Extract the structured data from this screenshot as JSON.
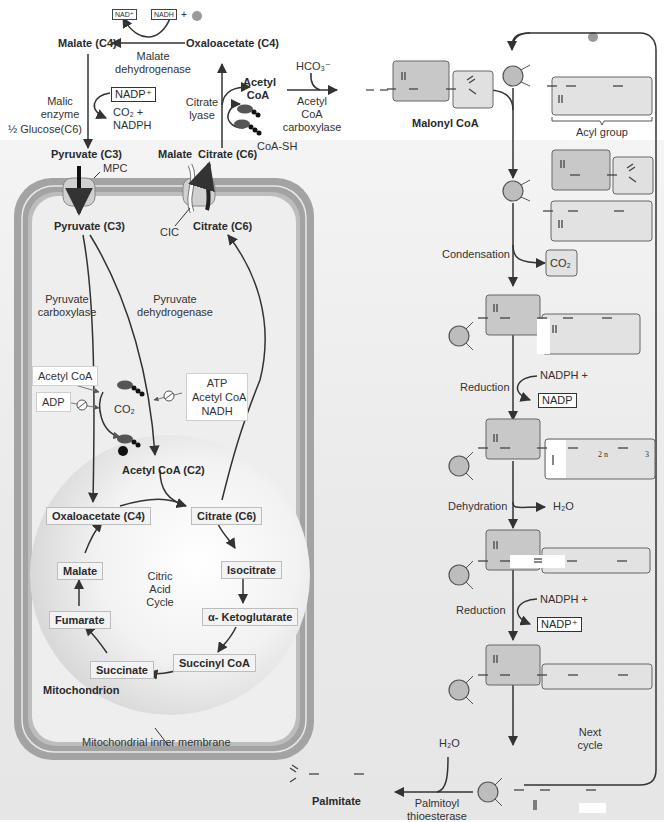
{
  "cytosol": {
    "nad_plus": "NAD⁺",
    "nadh": "NADH",
    "plus": "+",
    "h_plus": "H⁺",
    "malate_c4": "Malate (C4)",
    "oxaloacetate_c4": "Oxaloacetate (C4)",
    "malate_dehydrogenase": [
      "Malate",
      "dehydrogenase"
    ],
    "malic_enzyme": [
      "Malic",
      "enzyme"
    ],
    "nadp_plus": "NADP⁺",
    "co2_nadph": [
      "CO₂ +",
      "NADPH"
    ],
    "half_glucose": "½ Glucose(C6)",
    "pyruvate_c3": "Pyruvate (C3)",
    "malate": "Malate",
    "citrate_c6": "Citrate (C6)",
    "citrate_lyase": [
      "Citrate",
      "lyase"
    ],
    "acetyl_coa": [
      "Acetyl",
      "CoA"
    ],
    "adp": "ADP",
    "atp": "ATP",
    "coa_sh": "CoA-SH",
    "hco3": "HCO₃⁻",
    "acetyl_coa_carboxylase": [
      "Acetyl",
      "CoA",
      "carboxylase"
    ],
    "mpc": "MPC",
    "cic": "CIC"
  },
  "mitochondrion": {
    "pyruvate_c3": "Pyruvate (C3)",
    "citrate_c6": "Citrate (C6)",
    "pyruvate_carboxylase": [
      "Pyruvate",
      "carboxylase"
    ],
    "pyruvate_dehydrogenase": [
      "Pyruvate",
      "dehydrogenase"
    ],
    "activator_acetyl_coa": "Acetyl CoA",
    "inhibitor_adp": "ADP",
    "co2": "CO₂",
    "atp": "ATP",
    "adp": "ADP",
    "pi": "Pᵢ",
    "pdh_inhibitors": [
      "ATP",
      "Acetyl CoA",
      "NADH"
    ],
    "acetyl_coa_c2": "Acetyl CoA (C2)",
    "label": "Mitochondrion",
    "inner_membrane": "Mitochondrial inner membrane",
    "tca": {
      "title": [
        "Citric",
        "Acid",
        "Cycle"
      ],
      "oxaloacetate": "Oxaloacetate (C4)",
      "citrate": "Citrate (C6)",
      "isocitrate": "Isocitrate",
      "alpha_ketoglutarate": "α- Ketoglutarate",
      "succinyl_coa": "Succinyl CoA",
      "succinate": "Succinate",
      "fumarate": "Fumarate",
      "malate": "Malate"
    }
  },
  "fas": {
    "malonyl_coa": "Malonyl CoA",
    "acyl_group": "Acyl group",
    "condensation": "Condensation",
    "co2": "CO₂",
    "reduction1": "Reduction",
    "nadph_h1": "NADPH +",
    "nadp1": "NADP",
    "dehydration": "Dehydration",
    "h2o": "H₂O",
    "reduction2": "Reduction",
    "nadph_h2": "NADPH +",
    "nadp2": "NADP⁺",
    "h_plus": "H⁺",
    "next_cycle": [
      "Next",
      "cycle"
    ],
    "h2o_hydrolysis": "H₂O",
    "palmitoyl_thioesterase": [
      "Palmitoyl",
      "thioesterase"
    ],
    "palmitate": "Palmitate",
    "chain_2n": "2 n",
    "chain_3": "3"
  },
  "colors": {
    "membrane_outer": "#9a9a9a",
    "membrane_inner": "#b5b5b5",
    "matrix": "#ebebeb",
    "enzyme_circle": "#bdbdbd",
    "dark_box": "#c8c8c8",
    "light_box": "#e2e2e2",
    "arrow": "#333333"
  }
}
